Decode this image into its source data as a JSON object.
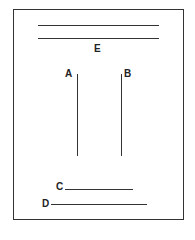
{
  "diagram": {
    "labels": {
      "a": "A",
      "b": "B",
      "c": "C",
      "d": "D",
      "e": "E"
    },
    "elements": [
      {
        "id": "E",
        "type": "double-horizontal-line",
        "description": "Two parallel horizontal lines at top, label E below"
      },
      {
        "id": "A",
        "type": "vertical-line",
        "description": "Left vertical line, label A at top-left"
      },
      {
        "id": "B",
        "type": "vertical-line",
        "description": "Right vertical line, label B at top-right"
      },
      {
        "id": "C",
        "type": "horizontal-line",
        "description": "Shorter horizontal line near bottom, label C at left"
      },
      {
        "id": "D",
        "type": "horizontal-line",
        "description": "Longer horizontal line at bottom, label D at left"
      }
    ],
    "colors": {
      "line": "#333333",
      "background": "#ffffff"
    }
  }
}
